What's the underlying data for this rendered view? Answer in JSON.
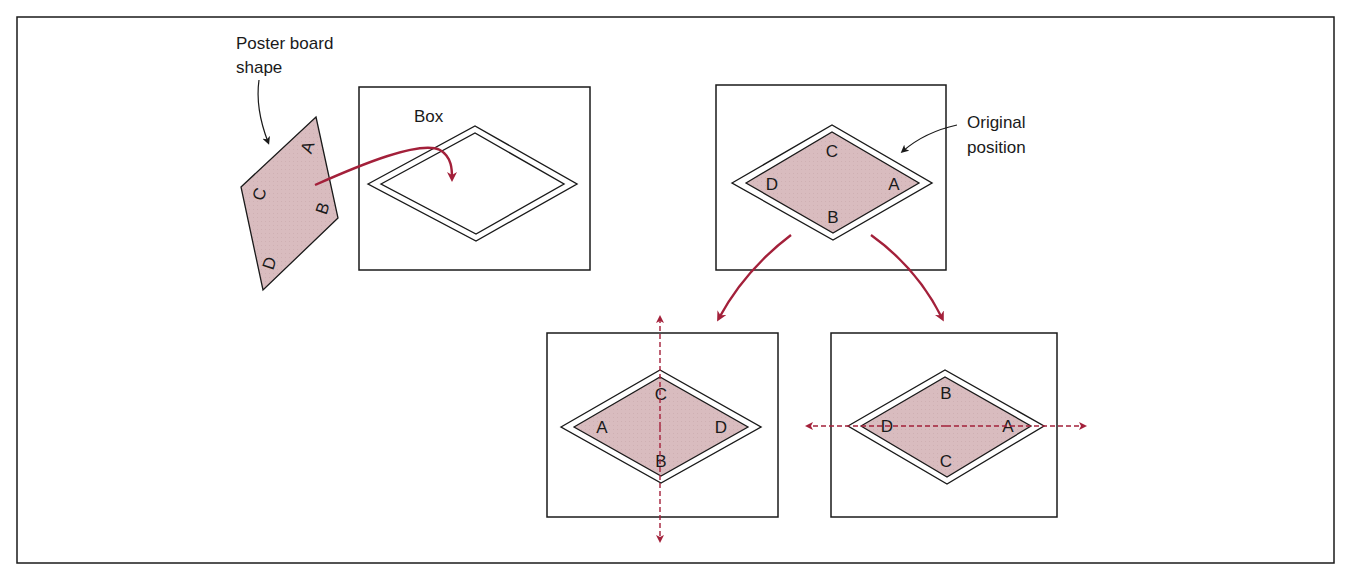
{
  "figure": {
    "labels": {
      "poster_board": [
        "Poster board",
        "shape"
      ],
      "box": "Box",
      "original_position": [
        "Original",
        "position"
      ]
    },
    "poster_shape_vertices": {
      "A": "A",
      "B": "B",
      "C": "C",
      "D": "D"
    },
    "original": {
      "top": "C",
      "left": "D",
      "right": "A",
      "bottom": "B"
    },
    "flip_vertical_axis": {
      "top": "C",
      "left": "A",
      "right": "D",
      "bottom": "B"
    },
    "flip_horizontal_axis": {
      "top": "B",
      "left": "D",
      "right": "A",
      "bottom": "C"
    },
    "colors": {
      "fill": "#d9bcbf",
      "arrow": "#a3203a",
      "line": "#1a1a1a"
    }
  }
}
